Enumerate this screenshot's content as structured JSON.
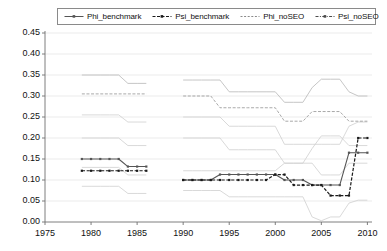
{
  "chart_data": {
    "type": "line",
    "title": "",
    "xlabel": "",
    "ylabel": "",
    "xlim": [
      1975,
      2010.5
    ],
    "ylim": [
      0.0,
      0.45
    ],
    "ytick_labels": [
      "0.45",
      "0.40",
      "0.35",
      "0.30",
      "0.25",
      "0.20",
      "0.15",
      "0.10",
      "0.05",
      "0.00"
    ],
    "ytick_values": [
      0.45,
      0.4,
      0.35,
      0.3,
      0.25,
      0.2,
      0.15,
      0.1,
      0.05,
      0.0
    ],
    "xtick_labels": [
      "1975",
      "1980",
      "1985",
      "1990",
      "1995",
      "2000",
      "2005",
      "2010"
    ],
    "xtick_values": [
      1975,
      1980,
      1985,
      1990,
      1995,
      2000,
      2005,
      2010
    ],
    "grid": true,
    "grid_axis": "y",
    "legend_position": "top",
    "legend": [
      "Phi_benchmark",
      "Psi_benchmark",
      "Phi_noSEO",
      "Psi_noSEO"
    ],
    "series": [
      {
        "name": "Phi_benchmark",
        "color": "#555555",
        "style": "solid-markers",
        "segments": [
          {
            "x": [
              1979,
              1980,
              1981,
              1982,
              1983,
              1984,
              1985,
              1986
            ],
            "y": [
              0.15,
              0.15,
              0.15,
              0.15,
              0.15,
              0.132,
              0.132,
              0.132
            ]
          },
          {
            "x": [
              1990,
              1991,
              1992,
              1993,
              1994,
              1995,
              1996,
              1997,
              1998,
              1999,
              2000,
              2001,
              2002,
              2003,
              2004,
              2005,
              2006,
              2007,
              2008,
              2009,
              2010
            ],
            "y": [
              0.1,
              0.1,
              0.1,
              0.1,
              0.113,
              0.113,
              0.113,
              0.113,
              0.113,
              0.113,
              0.113,
              0.1,
              0.1,
              0.1,
              0.088,
              0.088,
              0.088,
              0.088,
              0.165,
              0.165,
              0.165
            ]
          }
        ]
      },
      {
        "name": "Psi_benchmark",
        "color": "#1a1a1a",
        "style": "dashed-markers",
        "segments": [
          {
            "x": [
              1979,
              1980,
              1981,
              1982,
              1983,
              1984,
              1985,
              1986
            ],
            "y": [
              0.122,
              0.122,
              0.122,
              0.122,
              0.122,
              0.122,
              0.122,
              0.122
            ]
          },
          {
            "x": [
              1990,
              1991,
              1992,
              1993,
              1994,
              1995,
              1996,
              1997,
              1998,
              1999,
              2000,
              2001,
              2002,
              2003,
              2004,
              2005,
              2006,
              2007,
              2008,
              2009,
              2010
            ],
            "y": [
              0.1,
              0.1,
              0.1,
              0.1,
              0.1,
              0.1,
              0.1,
              0.1,
              0.1,
              0.1,
              0.113,
              0.113,
              0.088,
              0.088,
              0.088,
              0.088,
              0.063,
              0.063,
              0.063,
              0.2,
              0.2
            ]
          }
        ]
      },
      {
        "name": "Phi_noSEO",
        "color": "#b8b8b8",
        "style": "solid-light",
        "segments": [
          {
            "x": [
              1979,
              1980,
              1981,
              1982,
              1983,
              1984,
              1985,
              1986
            ],
            "y": [
              0.35,
              0.35,
              0.35,
              0.35,
              0.35,
              0.33,
              0.33,
              0.33
            ]
          },
          {
            "x": [
              1990,
              1991,
              1992,
              1993,
              1994,
              1995,
              1996,
              1997,
              1998,
              1999,
              2000,
              2001,
              2002,
              2003,
              2004,
              2005,
              2006,
              2007,
              2008,
              2009,
              2010
            ],
            "y": [
              0.338,
              0.338,
              0.338,
              0.338,
              0.338,
              0.31,
              0.31,
              0.31,
              0.31,
              0.31,
              0.31,
              0.285,
              0.285,
              0.285,
              0.32,
              0.34,
              0.34,
              0.34,
              0.31,
              0.3,
              0.3
            ]
          }
        ]
      },
      {
        "name": "Psi_noSEO",
        "color": "#9a9a9a",
        "style": "dashed-light",
        "segments": [
          {
            "x": [
              1979,
              1980,
              1981,
              1982,
              1983,
              1984,
              1985,
              1986
            ],
            "y": [
              0.305,
              0.305,
              0.305,
              0.305,
              0.305,
              0.305,
              0.305,
              0.305
            ]
          },
          {
            "x": [
              1990,
              1991,
              1992,
              1993,
              1994,
              1995,
              1996,
              1997,
              1998,
              1999,
              2000,
              2001,
              2002,
              2003,
              2004,
              2005,
              2006,
              2007,
              2008,
              2009,
              2010
            ],
            "y": [
              0.3,
              0.3,
              0.3,
              0.3,
              0.272,
              0.272,
              0.272,
              0.272,
              0.272,
              0.272,
              0.272,
              0.24,
              0.24,
              0.24,
              0.263,
              0.263,
              0.263,
              0.263,
              0.24,
              0.24,
              0.24
            ]
          }
        ]
      },
      {
        "name": "Phi_noSEO_lower",
        "color": "#cfcfcf",
        "style": "solid-light",
        "segments": [
          {
            "x": [
              1979,
              1980,
              1981,
              1982,
              1983,
              1984,
              1985,
              1986
            ],
            "y": [
              0.255,
              0.255,
              0.255,
              0.255,
              0.255,
              0.238,
              0.238,
              0.238
            ]
          },
          {
            "x": [
              1990,
              1991,
              1992,
              1993,
              1994,
              1995,
              1996,
              1997,
              1998,
              1999,
              2000,
              2001,
              2002,
              2003,
              2004,
              2005,
              2006,
              2007,
              2008,
              2009,
              2010
            ],
            "y": [
              0.25,
              0.25,
              0.25,
              0.25,
              0.25,
              0.228,
              0.228,
              0.228,
              0.228,
              0.228,
              0.228,
              0.185,
              0.185,
              0.185,
              0.185,
              0.185,
              0.185,
              0.185,
              0.228,
              0.238,
              0.238
            ]
          }
        ]
      },
      {
        "name": "Psi_noSEO_lower",
        "color": "#cfcfcf",
        "style": "solid-light",
        "segments": [
          {
            "x": [
              1979,
              1980,
              1981,
              1982,
              1983,
              1984,
              1985,
              1986
            ],
            "y": [
              0.2,
              0.2,
              0.2,
              0.2,
              0.2,
              0.182,
              0.182,
              0.182
            ]
          },
          {
            "x": [
              1990,
              1991,
              1992,
              1993,
              1994,
              1995,
              1996,
              1997,
              1998,
              1999,
              2000,
              2001,
              2002,
              2003,
              2004,
              2005,
              2006,
              2007,
              2008,
              2009,
              2010
            ],
            "y": [
              0.2,
              0.2,
              0.2,
              0.2,
              0.2,
              0.172,
              0.172,
              0.172,
              0.172,
              0.172,
              0.172,
              0.14,
              0.14,
              0.14,
              0.175,
              0.205,
              0.205,
              0.205,
              0.182,
              0.182,
              0.182
            ]
          }
        ]
      },
      {
        "name": "band_mid",
        "color": "#cfcfcf",
        "style": "solid-light",
        "segments": [
          {
            "x": [
              1979,
              1980,
              1981,
              1982,
              1983,
              1984,
              1985,
              1986
            ],
            "y": [
              0.13,
              0.13,
              0.13,
              0.13,
              0.13,
              0.112,
              0.112,
              0.112
            ]
          },
          {
            "x": [
              1990,
              1991,
              1992,
              1993,
              1994,
              1995,
              1996,
              1997,
              1998,
              1999,
              2000,
              2001,
              2002,
              2003,
              2004,
              2005,
              2006,
              2007,
              2008,
              2009,
              2010
            ],
            "y": [
              0.122,
              0.122,
              0.122,
              0.122,
              0.122,
              0.122,
              0.122,
              0.122,
              0.122,
              0.122,
              0.122,
              0.14,
              0.14,
              0.14,
              0.14,
              0.112,
              0.112,
              0.112,
              0.14,
              0.14,
              0.14
            ]
          }
        ]
      },
      {
        "name": "band_low",
        "color": "#cfcfcf",
        "style": "solid-light",
        "segments": [
          {
            "x": [
              1979,
              1980,
              1981,
              1982,
              1983,
              1984,
              1985,
              1986
            ],
            "y": [
              0.085,
              0.085,
              0.085,
              0.085,
              0.085,
              0.068,
              0.068,
              0.068
            ]
          },
          {
            "x": [
              1990,
              1991,
              1992,
              1993,
              1994,
              1995,
              1996,
              1997,
              1998,
              1999,
              2000,
              2001,
              2002,
              2003,
              2004,
              2005,
              2006,
              2007,
              2008,
              2009,
              2010
            ],
            "y": [
              0.075,
              0.075,
              0.075,
              0.075,
              0.075,
              0.06,
              0.06,
              0.06,
              0.06,
              0.06,
              0.06,
              0.06,
              0.06,
              0.06,
              0.012,
              0.003,
              0.012,
              0.012,
              0.045,
              0.052,
              0.052
            ]
          }
        ]
      }
    ]
  },
  "axes": {
    "plot_left": 45,
    "plot_right": 372,
    "plot_top": 33,
    "plot_bottom": 222
  },
  "legend": {
    "items": [
      {
        "label": "Phi_benchmark",
        "color": "#555555",
        "style": "solid-markers"
      },
      {
        "label": "Psi_benchmark",
        "color": "#1a1a1a",
        "style": "dashed-markers"
      },
      {
        "label": "Phi_noSEO",
        "color": "#8a8a8a",
        "style": "dotted-light"
      },
      {
        "label": "Psi_noSEO",
        "color": "#4a4a4a",
        "style": "dashdot"
      }
    ]
  }
}
